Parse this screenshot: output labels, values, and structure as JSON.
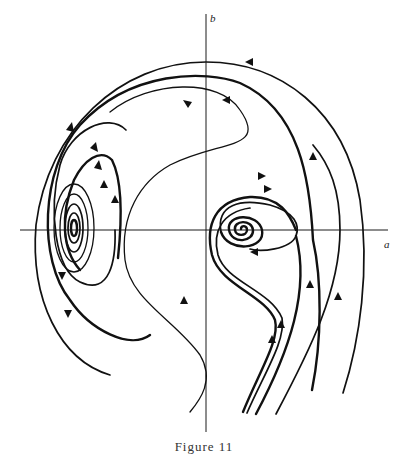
{
  "figure": {
    "caption": "Figure 11",
    "axes": {
      "x_label": "a",
      "y_label": "b"
    },
    "equilibria": [
      {
        "type": "stable-focus",
        "position": "left of b-axis on a-axis"
      },
      {
        "type": "spiral",
        "position": "right of b-axis on a-axis"
      }
    ],
    "colors": {
      "ink": "#111111",
      "paper": "#ffffff"
    }
  }
}
